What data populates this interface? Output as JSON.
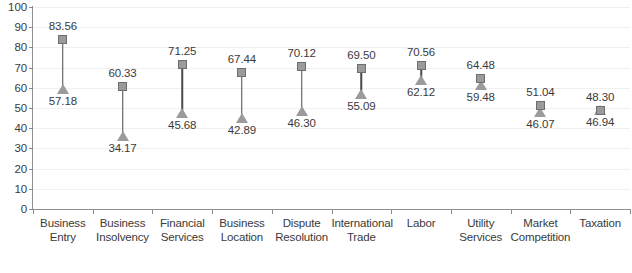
{
  "chart_data": {
    "type": "scatter",
    "subtype": "dumbbell-range",
    "title": "",
    "subtitle": "",
    "xlabel": "",
    "ylabel": "",
    "ylim": [
      0,
      100
    ],
    "yticks": [
      0,
      10,
      20,
      30,
      40,
      50,
      60,
      70,
      80,
      90,
      100
    ],
    "grid": true,
    "legend": "none",
    "categories": [
      "Business Entry",
      "Business Insolvency",
      "Financial Services",
      "Business Location",
      "Dispute Resolution",
      "International Trade",
      "Labor",
      "Utility Services",
      "Market Competition",
      "Taxation"
    ],
    "series": [
      {
        "name": "upper",
        "marker": "square",
        "values": [
          83.56,
          60.33,
          71.25,
          67.44,
          70.12,
          69.5,
          70.56,
          64.48,
          51.04,
          48.3
        ]
      },
      {
        "name": "lower",
        "marker": "triangle",
        "values": [
          57.18,
          34.17,
          45.68,
          42.89,
          46.3,
          55.09,
          62.12,
          59.48,
          46.07,
          46.94
        ]
      }
    ]
  },
  "axis": {
    "y_tick_labels": [
      "0",
      "10",
      "20",
      "30",
      "40",
      "50",
      "60",
      "70",
      "80",
      "90",
      "100"
    ],
    "x_categories": [
      {
        "line1": "Business",
        "line2": "Entry"
      },
      {
        "line1": "Business",
        "line2": "Insolvency"
      },
      {
        "line1": "Financial",
        "line2": "Services"
      },
      {
        "line1": "Business",
        "line2": "Location"
      },
      {
        "line1": "Dispute",
        "line2": "Resolution"
      },
      {
        "line1": "International",
        "line2": "Trade"
      },
      {
        "line1": "Labor",
        "line2": ""
      },
      {
        "line1": "Utility",
        "line2": "Services"
      },
      {
        "line1": "Market",
        "line2": "Competition"
      },
      {
        "line1": "Taxation",
        "line2": ""
      }
    ]
  },
  "value_labels": {
    "upper": [
      "83.56",
      "60.33",
      "71.25",
      "67.44",
      "70.12",
      "69.50",
      "70.56",
      "64.48",
      "51.04",
      "48.30"
    ],
    "lower": [
      "57.18",
      "34.17",
      "45.68",
      "42.89",
      "46.30",
      "55.09",
      "62.12",
      "59.48",
      "46.07",
      "46.94"
    ]
  },
  "colors": {
    "marker_fill": "#9b9b9b",
    "marker_stroke": "#6e6e6e",
    "connector": "#4a4a4a",
    "axis": "#8f8f8f",
    "grid": "#f0f0f0",
    "text": "#3a3a3a",
    "background": "#ffffff"
  }
}
